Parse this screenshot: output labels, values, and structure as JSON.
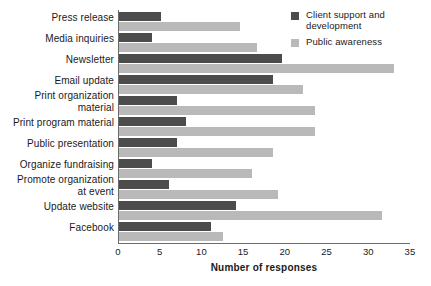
{
  "chart_data": {
    "type": "bar",
    "orientation": "horizontal",
    "title": "",
    "xlabel": "Number of responses",
    "ylabel": "",
    "xlim": [
      0,
      35
    ],
    "xticks": [
      0,
      5,
      10,
      15,
      20,
      25,
      30,
      35
    ],
    "grid": false,
    "legend_position": "top-right",
    "categories": [
      "Press release",
      "Media inquiries",
      "Newsletter",
      "Email update",
      "Print organization\nmaterial",
      "Print program material",
      "Public presentation",
      "Organize fundraising",
      "Promote organization\nat event",
      "Update website",
      "Facebook"
    ],
    "series": [
      {
        "name": "Client support and\ndevelopment",
        "color": "#4c4c4c",
        "values": [
          5,
          4,
          19.5,
          18.5,
          7,
          8,
          7,
          4,
          6,
          14,
          11
        ]
      },
      {
        "name": "Public awareness",
        "color": "#b9b9b9",
        "values": [
          14.5,
          16.5,
          33,
          22,
          23.5,
          23.5,
          18.5,
          16,
          19,
          31.5,
          12.5
        ]
      }
    ]
  },
  "legend": {
    "entries": [
      {
        "label": "Client support and\ndevelopment",
        "color": "#4c4c4c"
      },
      {
        "label": "Public awareness",
        "color": "#b9b9b9"
      }
    ]
  },
  "axis": {
    "x_title": "Number of responses",
    "tick_labels": [
      "0",
      "5",
      "10",
      "15",
      "20",
      "25",
      "30",
      "35"
    ]
  }
}
